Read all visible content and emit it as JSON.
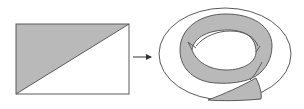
{
  "figure": {
    "colors": {
      "stroke": "#5a5a5a",
      "shade": "#b9b9b9",
      "background": "#ffffff"
    },
    "rectangle": {
      "x": 16,
      "y": 24,
      "width": 113,
      "height": 70
    },
    "arrow": {
      "x1": 133,
      "y1": 57,
      "x2": 152,
      "y2": 57
    },
    "torus": {
      "cx": 224,
      "cy": 54,
      "rx": 67,
      "ry": 46
    }
  }
}
